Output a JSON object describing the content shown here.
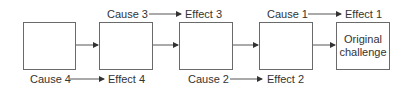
{
  "diagram": {
    "boxes": [
      {
        "label": ""
      },
      {
        "label": ""
      },
      {
        "label": ""
      },
      {
        "label": ""
      },
      {
        "label": "Original challenge",
        "line1": "Original",
        "line2": "challenge"
      }
    ],
    "top_labels": [
      {
        "cause": "Cause 3",
        "effect": "Effect 3"
      },
      {
        "cause": "Cause 1",
        "effect": "Effect 1"
      }
    ],
    "bottom_labels": [
      {
        "cause": "Cause 4",
        "effect": "Effect 4"
      },
      {
        "cause": "Cause 2",
        "effect": "Effect 2"
      }
    ],
    "colors": {
      "line": "#6a6a6a",
      "text": "#333333"
    }
  }
}
